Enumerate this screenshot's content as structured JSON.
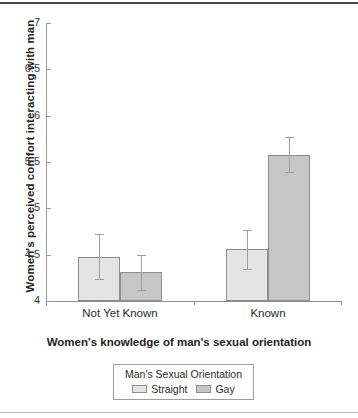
{
  "chart_data": {
    "type": "bar",
    "title": "",
    "xlabel": "Women's knowledge of man's sexual orientation",
    "ylabel": "Women's perceived comfort interacting with man",
    "categories": [
      "Not Yet Known",
      "Known"
    ],
    "ylim": [
      4,
      7
    ],
    "yticks": [
      "4",
      "4.5",
      "5",
      "5.5",
      "6",
      "6.5",
      "7"
    ],
    "ytick_values": [
      4,
      4.5,
      5,
      5.5,
      6,
      6.5,
      7
    ],
    "grid": false,
    "legend_position": "bottom",
    "legend_title": "Man's Sexual Orientation",
    "series": [
      {
        "name": "Straight",
        "color": "#e4e4e4",
        "values": [
          4.48,
          4.56
        ],
        "errors": [
          0.24,
          0.21
        ]
      },
      {
        "name": "Gay",
        "color": "#c6c6c6",
        "values": [
          4.31,
          5.58
        ],
        "errors": [
          0.19,
          0.19
        ]
      }
    ]
  },
  "legend": {
    "title": "Man's Sexual Orientation",
    "items": [
      {
        "label": "Straight",
        "swatch": "straight"
      },
      {
        "label": "Gay",
        "swatch": "gay"
      }
    ]
  }
}
